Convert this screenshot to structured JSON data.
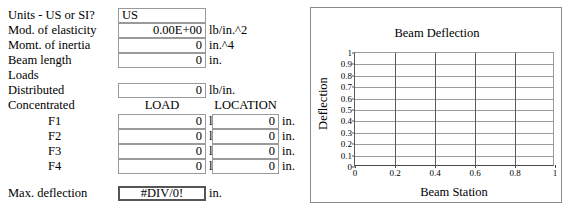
{
  "form": {
    "fields": [
      {
        "label": "Units - US or SI?",
        "value": "US",
        "align": "left",
        "unit": ""
      },
      {
        "label": "Mod. of elasticity",
        "value": "0.00E+00",
        "align": "right",
        "unit": "lb/in.^2"
      },
      {
        "label": "Momt. of inertia",
        "value": "0",
        "align": "right",
        "unit": "in.^4"
      },
      {
        "label": "Beam length",
        "value": "0",
        "align": "right",
        "unit": "in."
      }
    ],
    "loads_label": "Loads",
    "distributed": {
      "label": "Distributed",
      "value": "0",
      "unit": "lb/in."
    },
    "concentrated_label": "Concentrated",
    "col_headers": {
      "load": "LOAD",
      "location": "LOCATION"
    },
    "force_rows": [
      {
        "label": "F1",
        "load": "0",
        "load_unit": "lb",
        "location": "0",
        "location_unit": "in."
      },
      {
        "label": "F2",
        "load": "0",
        "load_unit": "lb",
        "location": "0",
        "location_unit": "in."
      },
      {
        "label": "F3",
        "load": "0",
        "load_unit": "lb",
        "location": "0",
        "location_unit": "in."
      },
      {
        "label": "F4",
        "load": "0",
        "load_unit": "lb",
        "location": "0",
        "location_unit": "in."
      }
    ],
    "max_deflection": {
      "label": "Max. deflection",
      "value": "#DIV/0!",
      "unit": "in."
    }
  },
  "chart_data": {
    "type": "line",
    "title": "Beam Deflection",
    "xlabel": "Beam Station",
    "ylabel": "Deflection",
    "xlim": [
      0,
      1
    ],
    "ylim": [
      0,
      1
    ],
    "xticks": [
      "0",
      "0.2",
      "0.4",
      "0.6",
      "0.8",
      "1"
    ],
    "xtick_values": [
      0,
      0.2,
      0.4,
      0.6,
      0.8,
      1
    ],
    "yticks": [
      "0",
      "0.1",
      "0.2",
      "0.3",
      "0.4",
      "0.5",
      "0.6",
      "0.7",
      "0.8",
      "0.9",
      "1"
    ],
    "ytick_values": [
      0,
      0.1,
      0.2,
      0.3,
      0.4,
      0.5,
      0.6,
      0.7,
      0.8,
      0.9,
      1
    ],
    "grid": true,
    "legend": false,
    "series": [
      {
        "name": "Deflection",
        "x": [],
        "values": []
      }
    ]
  }
}
